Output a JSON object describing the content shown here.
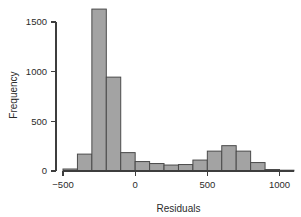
{
  "chart_data": {
    "type": "bar",
    "title": "",
    "subtitle": "",
    "xlabel": "Residuals",
    "ylabel": "Frequency",
    "xlim": [
      -500,
      1100
    ],
    "ylim": [
      0,
      1700
    ],
    "grid": false,
    "legend": null,
    "bin_width": 100,
    "xticks": [
      -500,
      0,
      500,
      1000
    ],
    "xticklabels": [
      "−500",
      "0",
      "500",
      "1000"
    ],
    "yticks": [
      0,
      500,
      1000,
      1500
    ],
    "yticklabels": [
      "0",
      "500",
      "1000",
      "1500"
    ],
    "bar_color": "#a3a3a3",
    "bar_edge_color": "#4a4a4a",
    "axis_color": "#3d3d3d",
    "bins": [
      {
        "x0": -500,
        "x1": -400,
        "value": 20
      },
      {
        "x0": -400,
        "x1": -300,
        "value": 170
      },
      {
        "x0": -300,
        "x1": -200,
        "value": 1630
      },
      {
        "x0": -200,
        "x1": -100,
        "value": 945
      },
      {
        "x0": -100,
        "x1": 0,
        "value": 185
      },
      {
        "x0": 0,
        "x1": 100,
        "value": 95
      },
      {
        "x0": 100,
        "x1": 200,
        "value": 75
      },
      {
        "x0": 200,
        "x1": 300,
        "value": 60
      },
      {
        "x0": 300,
        "x1": 400,
        "value": 65
      },
      {
        "x0": 400,
        "x1": 500,
        "value": 110
      },
      {
        "x0": 500,
        "x1": 600,
        "value": 200
      },
      {
        "x0": 600,
        "x1": 700,
        "value": 255
      },
      {
        "x0": 700,
        "x1": 800,
        "value": 200
      },
      {
        "x0": 800,
        "x1": 900,
        "value": 85
      },
      {
        "x0": 900,
        "x1": 1000,
        "value": 15
      },
      {
        "x0": 1000,
        "x1": 1100,
        "value": 8
      }
    ],
    "categories": [
      "-500..-400",
      "-400..-300",
      "-300..-200",
      "-200..-100",
      "-100..0",
      "0..100",
      "100..200",
      "200..300",
      "300..400",
      "400..500",
      "500..600",
      "600..700",
      "700..800",
      "800..900",
      "900..1000",
      "1000..1100"
    ],
    "values": [
      20,
      170,
      1630,
      945,
      185,
      95,
      75,
      60,
      65,
      110,
      200,
      255,
      200,
      85,
      15,
      8
    ]
  }
}
